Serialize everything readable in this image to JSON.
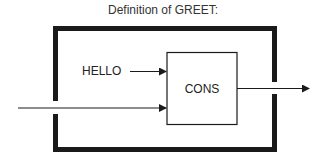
{
  "title": "Definition of GREET:",
  "inputs": [
    {
      "label": "HELLO"
    },
    {
      "label": ""
    }
  ],
  "function_box": {
    "label": "CONS"
  },
  "colors": {
    "stroke": "#1a1a1a",
    "text": "#222222",
    "background": "#ffffff"
  }
}
